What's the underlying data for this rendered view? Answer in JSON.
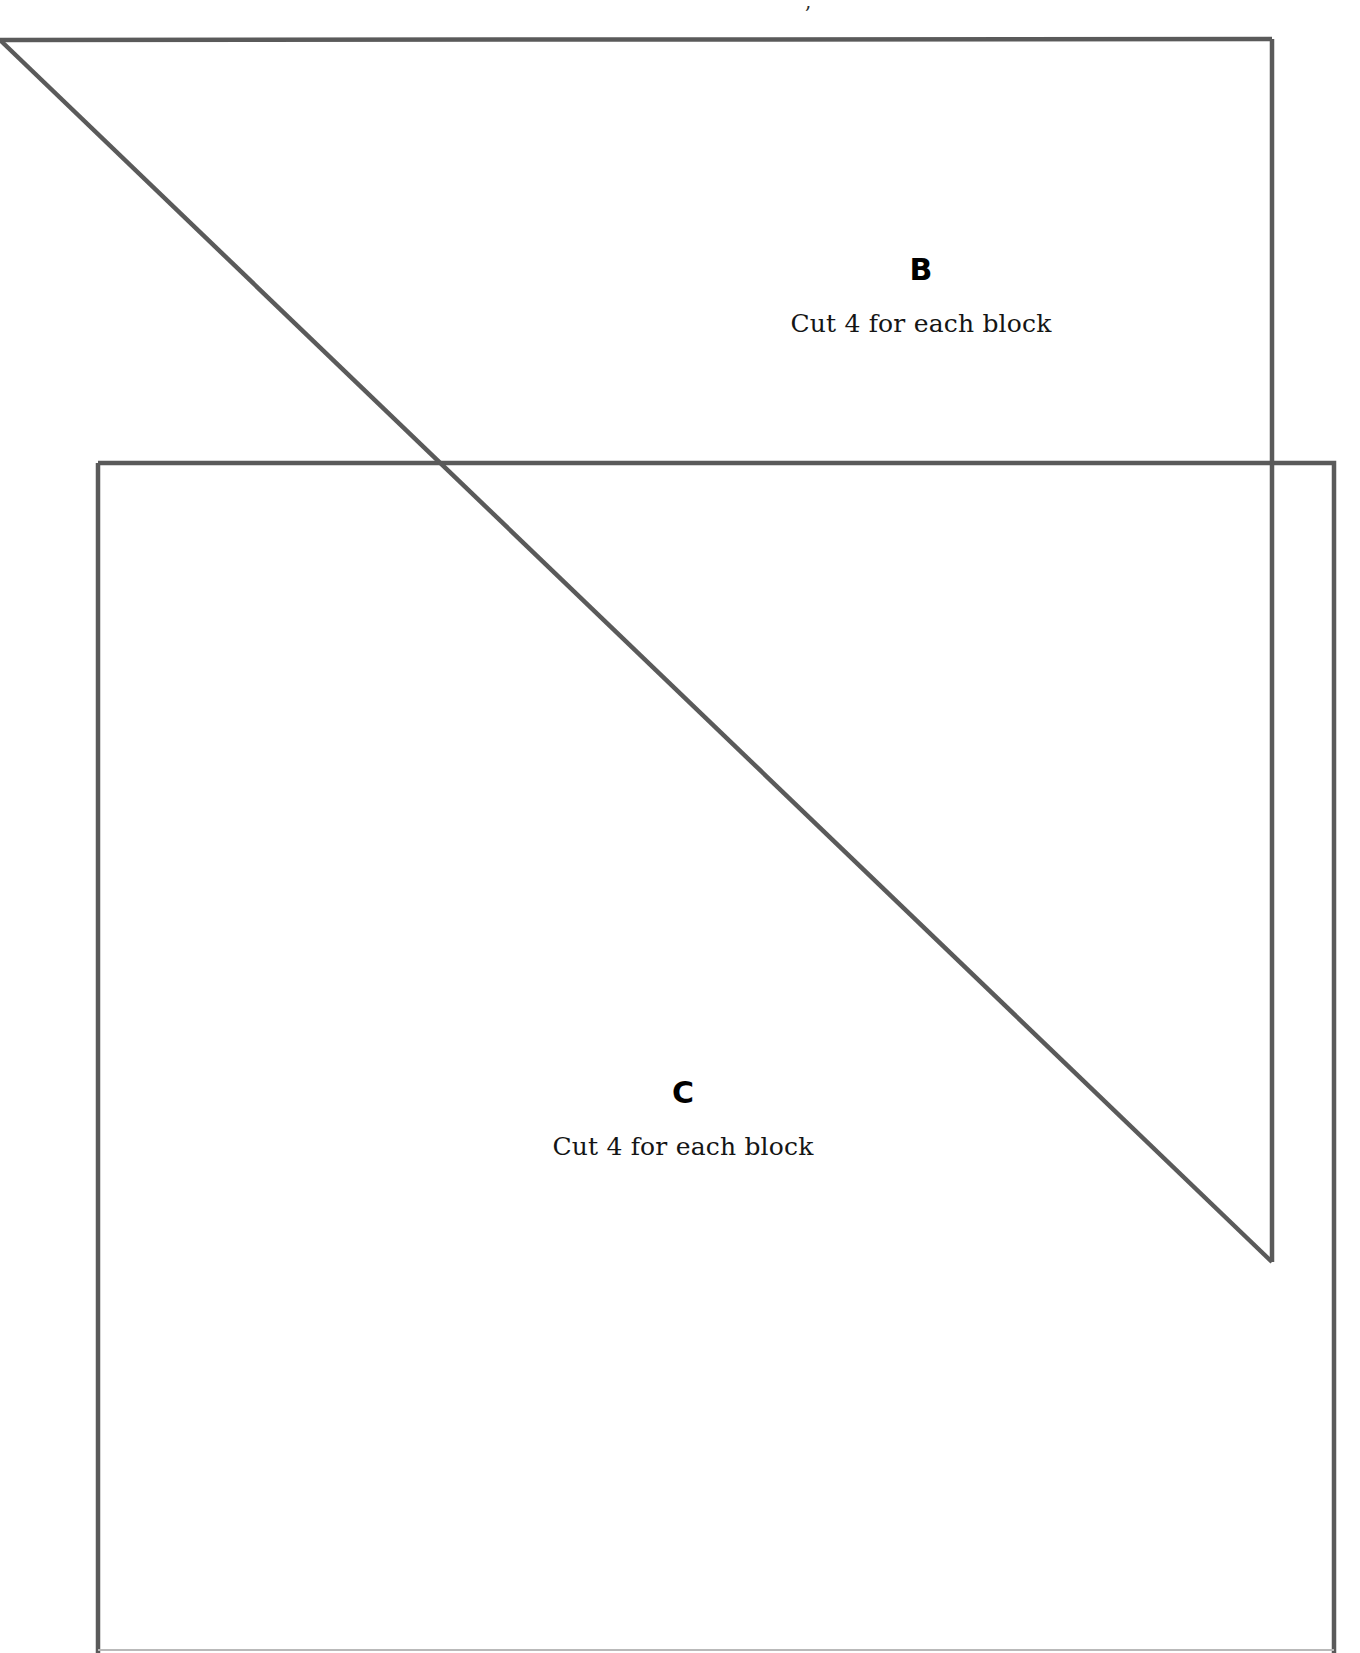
{
  "page": {
    "background_color": "#ffffff",
    "line_color": "#5a5a5a",
    "faint_line_color": "#b9b9b9",
    "width": 1360,
    "height": 1653
  },
  "top_fragment": {
    "text": ","
  },
  "pieces": [
    {
      "id": "B",
      "letter": "B",
      "note": "Cut 4 for each block",
      "shape": "right-triangle",
      "description": "Large right triangle with horizontal top edge, vertical right edge and hypotenuse from top-left to bottom-right",
      "vertices": [
        {
          "x": 0,
          "y": 40
        },
        {
          "x": 1272,
          "y": 39
        },
        {
          "x": 1272,
          "y": 1262
        }
      ]
    },
    {
      "id": "C",
      "letter": "C",
      "note": "Cut 4 for each block",
      "shape": "square",
      "description": "Large square overlapping the lower portion of piece B, extending past the bottom of the page",
      "vertices": [
        {
          "x": 98,
          "y": 463
        },
        {
          "x": 1334,
          "y": 463
        },
        {
          "x": 1334,
          "y": 1698
        },
        {
          "x": 98,
          "y": 1698
        }
      ]
    }
  ],
  "labels": {
    "b_letter": "B",
    "b_note": "Cut 4 for each block",
    "c_letter": "C",
    "c_note": "Cut 4 for each block"
  }
}
